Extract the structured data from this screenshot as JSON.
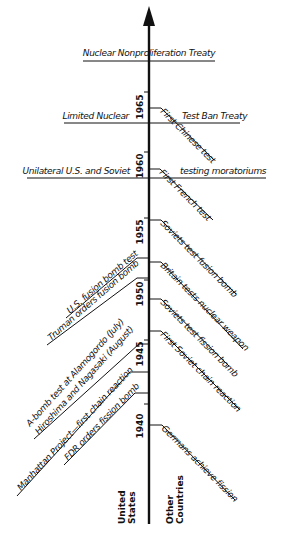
{
  "diagram": {
    "type": "timeline",
    "axis_arrow": "up",
    "column_headers": {
      "left": [
        "United",
        "States"
      ],
      "right": [
        "Other",
        "Countries"
      ]
    },
    "years": [
      "1965",
      "1960",
      "1955",
      "1950",
      "1945",
      "1940"
    ],
    "joint_events": [
      {
        "left": "Nuclear Nonproliferation Treaty",
        "right": ""
      },
      {
        "left": "Limited Nuclear",
        "right": "Test Ban Treaty"
      },
      {
        "left": "Unilateral U.S. and Soviet",
        "right": "testing moratoriums"
      }
    ],
    "us_events": [
      "U.S. fusion bomb test",
      "Truman orders fusion bomb",
      "A-bomb test at Alamogordo (July)",
      "Hiroshima and Nagasaki (August)",
      "Manhattan Project—first chain reaction",
      "FDR orders fission bomb"
    ],
    "other_events": [
      "First Chinese test",
      "First French test",
      "Soviets test fusion bomb",
      "Britain tests nuclear weapon",
      "Soviets test fission bomb",
      "First Soviet chain reaction",
      "Germans achieve fission"
    ]
  }
}
